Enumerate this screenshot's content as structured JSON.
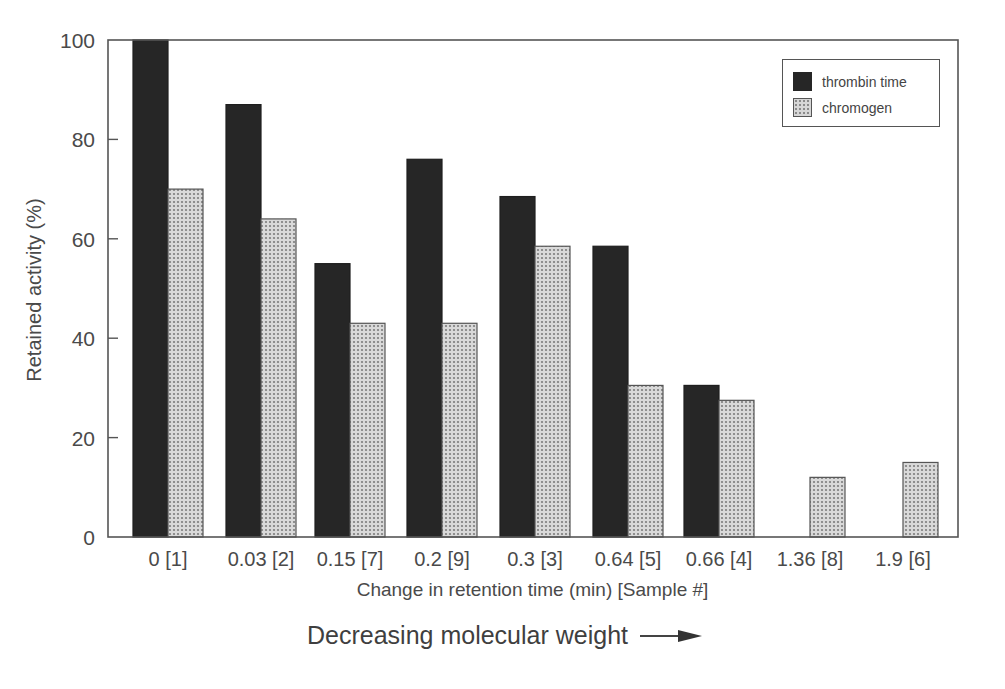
{
  "chart_data": {
    "type": "bar",
    "title": "",
    "xlabel": "Change in retention time (min) [Sample #]",
    "ylabel": "Retained activity (%)",
    "ylim": [
      0,
      100
    ],
    "yticks": [
      0,
      20,
      40,
      60,
      80,
      100
    ],
    "grid": false,
    "legend_position": "upper right",
    "categories": [
      "0 [1]",
      "0.03 [2]",
      "0.15 [7]",
      "0.2 [9]",
      "0.3 [3]",
      "0.64 [5]",
      "0.66 [4]",
      "1.36 [8]",
      "1.9 [6]"
    ],
    "series": [
      {
        "name": "thrombin time",
        "color": "#262626",
        "pattern": "solid",
        "values": [
          100,
          87,
          55,
          76,
          68.5,
          58.5,
          30.5,
          0,
          0
        ]
      },
      {
        "name": "chromogen",
        "color": "#cfcfcf",
        "pattern": "crosshatch",
        "values": [
          70,
          64,
          43,
          43,
          58.5,
          30.5,
          27.5,
          12,
          15
        ]
      }
    ],
    "annotation": "Decreasing molecular weight"
  }
}
